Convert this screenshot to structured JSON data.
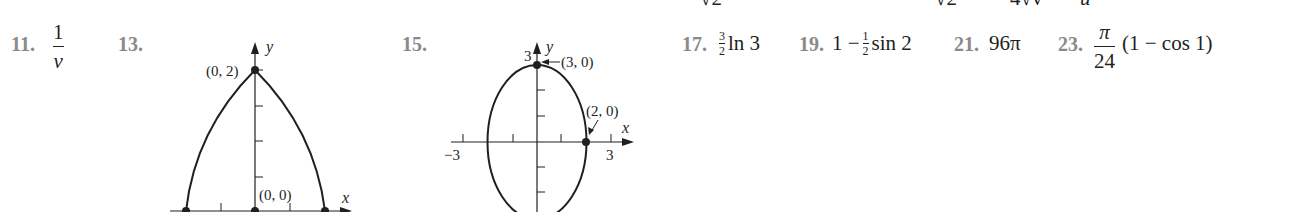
{
  "top_cutoff_fragments": [
    "√2",
    "√2",
    "4√v",
    "u"
  ],
  "answers": [
    {
      "number": "11.",
      "numerator": "1",
      "denominator": "v"
    },
    {
      "number": "13.",
      "graph": "graph_13"
    },
    {
      "number": "15.",
      "graph": "graph_15"
    },
    {
      "number": "17.",
      "coef_num": "3",
      "coef_den": "2",
      "rest": "ln 3"
    },
    {
      "number": "19.",
      "lead": "1 −",
      "coef_num": "1",
      "coef_den": "2",
      "rest": "sin 2"
    },
    {
      "number": "21.",
      "value": "96π"
    },
    {
      "number": "23.",
      "numerator": "π",
      "denominator": "24",
      "rest": "(1 − cos 1)"
    }
  ],
  "graph_13": {
    "axis_x_label": "x",
    "axis_y_label": "y",
    "point_top_label": "(0, 2)",
    "point_origin_label": "(0, 0)"
  },
  "graph_15": {
    "axis_x_label": "x",
    "axis_y_label": "y",
    "y_tick_label": "3",
    "x_tick_neg_label": "−3",
    "x_tick_pos_label": "3",
    "point_top_label": "(3, 0)",
    "point_right_label": "(2, 0)"
  }
}
